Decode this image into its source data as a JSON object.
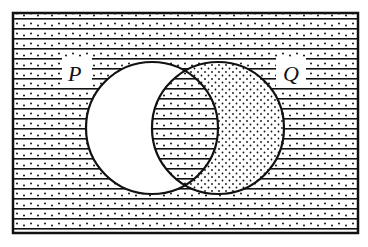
{
  "diagram": {
    "type": "venn",
    "universal_set": {
      "shading": "horizontal-lines-with-dots",
      "x": 13,
      "y": 13,
      "width": 345,
      "height": 220
    },
    "sets": [
      {
        "label": "P",
        "cx": 152,
        "cy": 128,
        "r": 66,
        "only_region_shading": "none",
        "label_x": 75,
        "label_y": 80
      },
      {
        "label": "Q",
        "cx": 218,
        "cy": 128,
        "r": 66,
        "only_region_shading": "dots",
        "label_x": 287,
        "label_y": 80
      }
    ],
    "intersection_shading": "horizontal-lines-with-dots",
    "colors": {
      "ink": "#111111",
      "paper": "#ffffff"
    }
  }
}
